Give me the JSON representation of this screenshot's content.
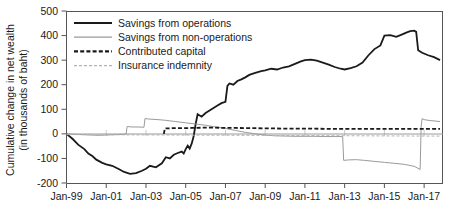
{
  "chart_data": {
    "type": "line",
    "title": "",
    "xlabel": "",
    "ylabel": "Cumulative change in net wealth (in thousands of baht)",
    "ylabel_line1": "Cumulative change in net wealth",
    "ylabel_line2": "(in thousands of baht)",
    "ylim": [
      -200,
      500
    ],
    "ytick_labels": [
      "500",
      "400",
      "300",
      "200",
      "100",
      "0",
      "-100",
      "-200"
    ],
    "ytick_values": [
      500,
      400,
      300,
      200,
      100,
      0,
      -100,
      -200
    ],
    "xlim": [
      "Jan-99",
      "Jan-18"
    ],
    "xtick_labels": [
      "Jan-99",
      "Jan-01",
      "Jan-03",
      "Jan-05",
      "Jan-07",
      "Jan-09",
      "Jan-11",
      "Jan-13",
      "Jan-15",
      "Jan-17"
    ],
    "xtick_values": [
      1999,
      2001,
      2003,
      2005,
      2007,
      2009,
      2011,
      2013,
      2015,
      2017
    ],
    "grid": false,
    "legend_position": "top-left",
    "colors": {
      "operations": "#1a1a1a",
      "non_operations": "#9a9a9a",
      "contributed_capital": "#1a1a1a",
      "insurance_indemnity": "#b4b4b4",
      "axis": "#555555"
    },
    "series": [
      {
        "name": "Savings from operations",
        "style": "solid",
        "width": 1.8,
        "color": "#1a1a1a",
        "x": [
          1999.0,
          1999.3,
          1999.6,
          1999.9,
          2000.1,
          2000.3,
          2000.5,
          2000.8,
          2001.0,
          2001.3,
          2001.6,
          2001.9,
          2002.2,
          2002.5,
          2002.8,
          2003.0,
          2003.2,
          2003.5,
          2003.8,
          2004.0,
          2004.2,
          2004.4,
          2004.6,
          2004.8,
          2004.9,
          2005.0,
          2005.1,
          2005.2,
          2005.3,
          2005.4,
          2005.5,
          2005.6,
          2005.8,
          2006.0,
          2006.2,
          2006.4,
          2006.6,
          2006.8,
          2007.0,
          2007.1,
          2007.2,
          2007.4,
          2007.6,
          2007.8,
          2008.0,
          2008.2,
          2008.5,
          2008.8,
          2009.0,
          2009.3,
          2009.6,
          2009.9,
          2010.2,
          2010.5,
          2010.8,
          2011.0,
          2011.3,
          2011.6,
          2011.9,
          2012.2,
          2012.5,
          2012.8,
          2013.0,
          2013.3,
          2013.6,
          2013.9,
          2014.2,
          2014.5,
          2014.8,
          2015.0,
          2015.3,
          2015.6,
          2015.9,
          2016.1,
          2016.3,
          2016.5,
          2016.6,
          2016.7,
          2016.9,
          2017.2,
          2017.5,
          2017.8
        ],
        "y": [
          0,
          -20,
          -45,
          -62,
          -80,
          -90,
          -105,
          -118,
          -124,
          -130,
          -142,
          -155,
          -163,
          -160,
          -150,
          -142,
          -130,
          -136,
          -120,
          -95,
          -100,
          -85,
          -78,
          -72,
          -80,
          -62,
          -48,
          -60,
          -40,
          -10,
          40,
          80,
          70,
          85,
          95,
          105,
          115,
          125,
          130,
          195,
          205,
          200,
          215,
          222,
          230,
          240,
          248,
          255,
          258,
          265,
          262,
          270,
          275,
          285,
          295,
          300,
          302,
          298,
          290,
          282,
          272,
          265,
          262,
          268,
          275,
          290,
          320,
          345,
          360,
          400,
          402,
          395,
          405,
          412,
          418,
          420,
          415,
          340,
          330,
          320,
          312,
          300
        ]
      },
      {
        "name": "Savings from non-operations",
        "style": "solid",
        "width": 1.0,
        "color": "#9a9a9a",
        "x": [
          1999.0,
          1999.5,
          2000.0,
          2000.3,
          2000.6,
          2000.9,
          2001.2,
          2001.5,
          2001.8,
          2002.0,
          2002.05,
          2002.3,
          2002.6,
          2002.9,
          2002.95,
          2003.2,
          2003.6,
          2004.0,
          2004.5,
          2005.0,
          2005.5,
          2006.0,
          2006.5,
          2007.0,
          2007.5,
          2008.0,
          2008.5,
          2009.0,
          2009.5,
          2010.0,
          2010.5,
          2011.0,
          2011.5,
          2012.0,
          2012.5,
          2012.9,
          2012.95,
          2013.2,
          2013.6,
          2014.0,
          2014.5,
          2015.0,
          2015.5,
          2016.0,
          2016.5,
          2016.8,
          2016.85,
          2016.9,
          2017.0,
          2017.3,
          2017.6,
          2017.8
        ],
        "y": [
          0,
          -2,
          -4,
          -5,
          -6,
          -5,
          -4,
          -3,
          -2,
          -1,
          30,
          28,
          28,
          27,
          62,
          60,
          58,
          55,
          50,
          45,
          40,
          35,
          28,
          22,
          14,
          6,
          0,
          -5,
          -8,
          -9,
          -10,
          -10,
          -10,
          -11,
          -11,
          -11,
          -108,
          -106,
          -105,
          -108,
          -112,
          -116,
          -120,
          -124,
          -132,
          -145,
          30,
          62,
          58,
          54,
          52,
          50
        ]
      },
      {
        "name": "Contributed capital",
        "style": "dashed",
        "width": 1.8,
        "color": "#1a1a1a",
        "x": [
          2003.9,
          2003.95,
          2004.3,
          2004.8,
          2005.3,
          2005.8,
          2006.5,
          2007.5,
          2008.5,
          2009.5,
          2010.5,
          2011.5,
          2012.5,
          2013.5,
          2014.5,
          2015.5,
          2016.5,
          2017.2,
          2017.8
        ],
        "y": [
          0,
          22,
          23,
          23,
          24,
          25,
          25,
          24,
          23,
          22,
          21,
          21,
          20,
          20,
          20,
          20,
          20,
          20,
          20
        ]
      },
      {
        "name": "Insurance indemnity",
        "style": "dashed",
        "width": 1.0,
        "color": "#b4b4b4",
        "x": [
          1999.0,
          2002.0,
          2005.0,
          2008.0,
          2011.0,
          2014.0,
          2017.0,
          2017.8
        ],
        "y": [
          -3,
          -4,
          -5,
          -6,
          -7,
          -8,
          -9,
          -9
        ]
      }
    ]
  },
  "legend": {
    "items": [
      {
        "label": "Savings from operations",
        "style": "solid",
        "color": "#1a1a1a",
        "width": 2.2
      },
      {
        "label": "Savings from non-operations",
        "style": "solid",
        "color": "#9a9a9a",
        "width": 1.2
      },
      {
        "label": "Contributed capital",
        "style": "dashed",
        "color": "#1a1a1a",
        "width": 2.2
      },
      {
        "label": "Insurance indemnity",
        "style": "dashed",
        "color": "#b4b4b4",
        "width": 1.2
      }
    ]
  }
}
